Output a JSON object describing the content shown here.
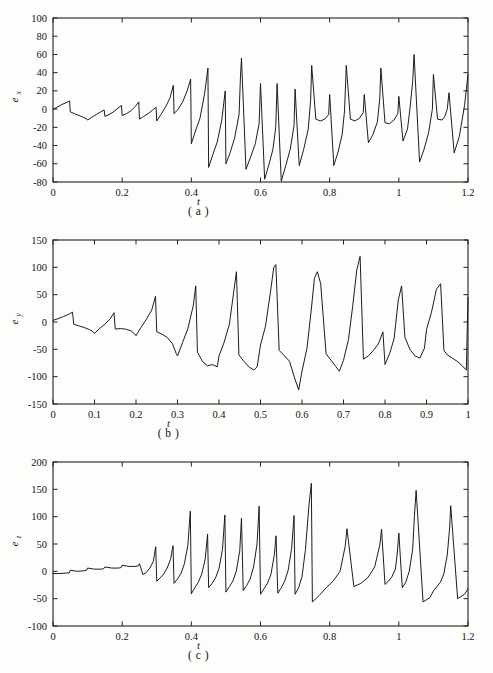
{
  "figure": {
    "background_color": "#fdfdfb",
    "line_color": "#111111",
    "axis_color": "#222222"
  },
  "panels": [
    {
      "id": "a",
      "caption": "( a )",
      "xlabel": "t",
      "ylabel_base": "e",
      "ylabel_sub": "x"
    },
    {
      "id": "b",
      "caption": "( b )",
      "xlabel": "t",
      "ylabel_base": "e",
      "ylabel_sub": "y"
    },
    {
      "id": "c",
      "caption": "( c )",
      "xlabel": "t",
      "ylabel_base": "e",
      "ylabel_sub": "z"
    }
  ],
  "chart_data": [
    {
      "type": "line",
      "panel": "a",
      "title": "",
      "xlabel": "t",
      "ylabel": "e_x",
      "xlim": [
        0,
        1.2
      ],
      "ylim": [
        -80,
        100
      ],
      "xticks": [
        0,
        0.2,
        0.4,
        0.6,
        0.8,
        1,
        1.2
      ],
      "xticklabels": [
        "0",
        "0.2",
        "0.4",
        "0.6",
        "0.8",
        "1",
        "1.2"
      ],
      "yticks": [
        -80,
        -60,
        -40,
        -20,
        0,
        20,
        40,
        60,
        80,
        100
      ],
      "yticklabels": [
        "-80",
        "-60",
        "-40",
        "-20",
        "0",
        "20",
        "40",
        "60",
        "80",
        "100"
      ],
      "grid": false,
      "legend": null,
      "series": [
        {
          "name": "e_x",
          "x": [
            0,
            0.012,
            0.025,
            0.038,
            0.048,
            0.05,
            0.062,
            0.075,
            0.088,
            0.098,
            0.1,
            0.112,
            0.125,
            0.138,
            0.148,
            0.15,
            0.162,
            0.175,
            0.188,
            0.198,
            0.2,
            0.212,
            0.225,
            0.238,
            0.248,
            0.25,
            0.262,
            0.275,
            0.288,
            0.298,
            0.3,
            0.312,
            0.325,
            0.338,
            0.348,
            0.35,
            0.362,
            0.375,
            0.388,
            0.398,
            0.4,
            0.412,
            0.425,
            0.438,
            0.448,
            0.45,
            0.462,
            0.475,
            0.488,
            0.498,
            0.5,
            0.512,
            0.525,
            0.538,
            0.542,
            0.545,
            0.558,
            0.572,
            0.585,
            0.596,
            0.6,
            0.612,
            0.625,
            0.636,
            0.644,
            0.648,
            0.66,
            0.673,
            0.686,
            0.697,
            0.7,
            0.712,
            0.725,
            0.738,
            0.745,
            0.748,
            0.76,
            0.773,
            0.786,
            0.797,
            0.8,
            0.812,
            0.825,
            0.836,
            0.843,
            0.848,
            0.86,
            0.873,
            0.886,
            0.897,
            0.9,
            0.912,
            0.925,
            0.938,
            0.945,
            0.948,
            0.96,
            0.973,
            0.986,
            0.997,
            1.0,
            1.012,
            1.025,
            1.032,
            1.04,
            1.044,
            1.06,
            1.073,
            1.086,
            1.097,
            1.1,
            1.112,
            1.125,
            1.133,
            1.14,
            1.145,
            1.16,
            1.175,
            1.19,
            1.2
          ],
          "y": [
            0,
            2,
            5,
            7,
            9,
            -3,
            -5,
            -7,
            -9,
            -11,
            -12,
            -9,
            -6,
            -3,
            -1,
            -8,
            -6,
            -3,
            1,
            4,
            -7,
            -5,
            -2,
            3,
            8,
            -11,
            -8,
            -5,
            -1,
            2,
            -13,
            -6,
            2,
            12,
            26,
            -5,
            0,
            8,
            20,
            33,
            -38,
            -24,
            -10,
            16,
            45,
            -64,
            -50,
            -36,
            -12,
            20,
            -60,
            -48,
            -32,
            -6,
            35,
            56,
            -66,
            -52,
            -38,
            -16,
            28,
            -77,
            -60,
            -44,
            -20,
            28,
            -79,
            -62,
            -44,
            -18,
            22,
            -62,
            -44,
            -22,
            10,
            48,
            -11,
            -13,
            -11,
            -6,
            16,
            -62,
            -46,
            -28,
            -2,
            48,
            -11,
            -13,
            -10,
            -4,
            16,
            -37,
            -28,
            -14,
            12,
            45,
            -15,
            -16,
            -12,
            -5,
            14,
            -35,
            -22,
            0,
            30,
            60,
            -58,
            -44,
            -26,
            0,
            38,
            -11,
            -12,
            -8,
            0,
            18,
            -48,
            -30,
            4,
            38,
            1
          ]
        }
      ]
    },
    {
      "type": "line",
      "panel": "b",
      "title": "",
      "xlabel": "t",
      "ylabel": "e_y",
      "xlim": [
        0,
        1.0
      ],
      "ylim": [
        -150,
        150
      ],
      "xticks": [
        0,
        0.1,
        0.2,
        0.3,
        0.4,
        0.5,
        0.6,
        0.7,
        0.8,
        0.9,
        1
      ],
      "xticklabels": [
        "0",
        "0.1",
        "0.2",
        "0.3",
        "0.4",
        "0.5",
        "0.6",
        "0.7",
        "0.8",
        "0.9",
        "1"
      ],
      "yticks": [
        -150,
        -100,
        -50,
        0,
        50,
        100,
        150
      ],
      "yticklabels": [
        "-150",
        "-100",
        "-50",
        "0",
        "50",
        "100",
        "150"
      ],
      "grid": false,
      "legend": null,
      "series": [
        {
          "name": "e_y",
          "x": [
            0,
            0.012,
            0.025,
            0.038,
            0.047,
            0.05,
            0.062,
            0.075,
            0.088,
            0.097,
            0.1,
            0.112,
            0.125,
            0.138,
            0.147,
            0.15,
            0.162,
            0.175,
            0.188,
            0.197,
            0.2,
            0.212,
            0.225,
            0.238,
            0.247,
            0.25,
            0.262,
            0.275,
            0.288,
            0.297,
            0.3,
            0.312,
            0.325,
            0.338,
            0.344,
            0.348,
            0.36,
            0.372,
            0.384,
            0.396,
            0.4,
            0.412,
            0.425,
            0.436,
            0.442,
            0.448,
            0.46,
            0.472,
            0.484,
            0.492,
            0.5,
            0.512,
            0.524,
            0.532,
            0.537,
            0.545,
            0.558,
            0.57,
            0.582,
            0.592,
            0.6,
            0.612,
            0.622,
            0.63,
            0.637,
            0.645,
            0.658,
            0.67,
            0.682,
            0.69,
            0.7,
            0.712,
            0.722,
            0.732,
            0.74,
            0.748,
            0.76,
            0.772,
            0.784,
            0.795,
            0.8,
            0.812,
            0.822,
            0.832,
            0.84,
            0.848,
            0.86,
            0.872,
            0.884,
            0.895,
            0.9,
            0.912,
            0.924,
            0.934,
            0.942,
            0.95,
            0.962,
            0.974,
            0.986,
            0.996,
            1.0
          ],
          "y": [
            3,
            6,
            10,
            14,
            18,
            -4,
            -7,
            -10,
            -14,
            -18,
            -21,
            -12,
            -4,
            6,
            17,
            -13,
            -12,
            -13,
            -16,
            -22,
            -25,
            -10,
            5,
            22,
            47,
            -18,
            -22,
            -28,
            -40,
            -58,
            -62,
            -38,
            -12,
            30,
            66,
            -55,
            -72,
            -80,
            -78,
            -82,
            -62,
            -38,
            -4,
            58,
            92,
            -60,
            -72,
            -82,
            -88,
            -82,
            -42,
            -8,
            55,
            100,
            105,
            -52,
            -62,
            -72,
            -102,
            -124,
            -90,
            -48,
            20,
            80,
            92,
            70,
            -58,
            -70,
            -82,
            -90,
            -70,
            -32,
            28,
            95,
            120,
            -68,
            -62,
            -52,
            -40,
            -18,
            -78,
            -56,
            -30,
            40,
            66,
            -28,
            -50,
            -62,
            -66,
            -48,
            -14,
            18,
            60,
            70,
            -52,
            -60,
            -66,
            -72,
            -80,
            -88,
            45
          ]
        }
      ]
    },
    {
      "type": "line",
      "panel": "c",
      "title": "",
      "xlabel": "t",
      "ylabel": "e_z",
      "xlim": [
        0,
        1.2
      ],
      "ylim": [
        -100,
        200
      ],
      "xticks": [
        0,
        0.2,
        0.4,
        0.6,
        0.8,
        1,
        1.2
      ],
      "xticklabels": [
        "0",
        "0.2",
        "0.4",
        "0.6",
        "0.8",
        "1",
        "1.2"
      ],
      "yticks": [
        -100,
        -50,
        0,
        50,
        100,
        150,
        200
      ],
      "yticklabels": [
        "-100",
        "-50",
        "0",
        "50",
        "100",
        "150",
        "200"
      ],
      "grid": false,
      "legend": null,
      "series": [
        {
          "name": "e_z",
          "x": [
            0,
            0.02,
            0.04,
            0.047,
            0.05,
            0.07,
            0.09,
            0.097,
            0.1,
            0.12,
            0.14,
            0.147,
            0.15,
            0.17,
            0.19,
            0.197,
            0.2,
            0.22,
            0.24,
            0.247,
            0.25,
            0.26,
            0.27,
            0.28,
            0.29,
            0.297,
            0.3,
            0.31,
            0.32,
            0.33,
            0.34,
            0.347,
            0.35,
            0.36,
            0.37,
            0.38,
            0.39,
            0.397,
            0.4,
            0.41,
            0.42,
            0.43,
            0.44,
            0.447,
            0.45,
            0.46,
            0.47,
            0.48,
            0.49,
            0.497,
            0.5,
            0.51,
            0.52,
            0.53,
            0.54,
            0.545,
            0.55,
            0.56,
            0.57,
            0.58,
            0.59,
            0.596,
            0.6,
            0.61,
            0.62,
            0.63,
            0.64,
            0.645,
            0.65,
            0.66,
            0.67,
            0.68,
            0.69,
            0.697,
            0.7,
            0.71,
            0.72,
            0.73,
            0.74,
            0.747,
            0.75,
            0.77,
            0.79,
            0.81,
            0.83,
            0.845,
            0.85,
            0.87,
            0.89,
            0.91,
            0.93,
            0.945,
            0.95,
            0.96,
            0.97,
            0.98,
            0.99,
            0.995,
            1.0,
            1.01,
            1.02,
            1.03,
            1.04,
            1.045,
            1.05,
            1.07,
            1.09,
            1.1,
            1.11,
            1.12,
            1.13,
            1.14,
            1.147,
            1.15,
            1.17,
            1.19,
            1.2
          ],
          "y": [
            -4,
            -4,
            -3,
            -3,
            2,
            0,
            1,
            2,
            6,
            4,
            4,
            5,
            8,
            6,
            6,
            7,
            11,
            9,
            9,
            10,
            14,
            -6,
            -2,
            6,
            18,
            45,
            -18,
            -12,
            -5,
            6,
            22,
            47,
            -22,
            -14,
            -4,
            14,
            48,
            110,
            -41,
            -30,
            -20,
            -5,
            22,
            68,
            -30,
            -22,
            -12,
            5,
            40,
            103,
            -38,
            -28,
            -18,
            0,
            38,
            97,
            -35,
            -26,
            -14,
            8,
            50,
            119,
            -42,
            -32,
            -22,
            -6,
            30,
            65,
            -40,
            -30,
            -18,
            2,
            42,
            102,
            -42,
            -30,
            -10,
            40,
            120,
            161,
            -56,
            -44,
            -30,
            -18,
            0,
            46,
            78,
            -28,
            -22,
            -12,
            8,
            48,
            77,
            -24,
            -18,
            -10,
            4,
            30,
            70,
            -30,
            -20,
            0,
            40,
            100,
            148,
            -56,
            -48,
            -36,
            -28,
            -20,
            -5,
            30,
            80,
            120,
            -50,
            -42,
            -32,
            -28
          ]
        }
      ]
    }
  ]
}
